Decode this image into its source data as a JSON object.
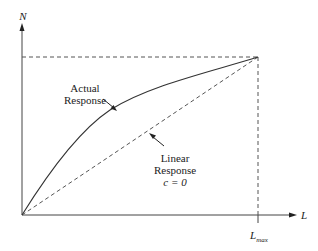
{
  "diagram": {
    "axes": {
      "y_label": "N",
      "x_label": "L",
      "x_tick_label_main": "L",
      "x_tick_label_sub": "max"
    },
    "annotations": {
      "actual": {
        "line1": "Actual",
        "line2": "Response"
      },
      "linear": {
        "line1": "Linear",
        "line2": "Response",
        "line3": "c = 0"
      }
    },
    "colors": {
      "line": "#333333",
      "background": "#ffffff"
    }
  }
}
